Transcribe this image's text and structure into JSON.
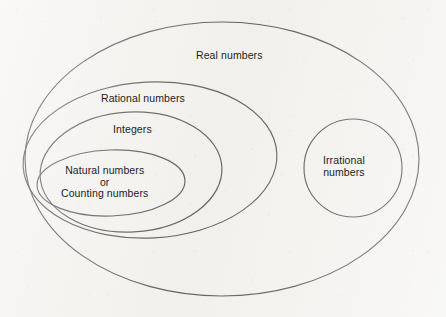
{
  "diagram": {
    "background_color": "#f4f3f0",
    "stroke_color": "#1f1f1f",
    "text_color": "#1c1c1c",
    "sets": {
      "real": {
        "label": "Real numbers",
        "shape": "ellipse",
        "cx": 222,
        "cy": 159,
        "rx": 197,
        "ry": 137
      },
      "rational": {
        "label": "Rational numbers",
        "shape": "ellipse",
        "cx": 150,
        "cy": 160,
        "rx": 127,
        "ry": 78
      },
      "integers": {
        "label": "Integers",
        "shape": "ellipse",
        "cx": 131,
        "cy": 172,
        "rx": 91,
        "ry": 60
      },
      "natural": {
        "label_line_1": "Natural numbers",
        "label_line_2": "or",
        "label_line_3": "Counting numbers",
        "shape": "ellipse",
        "cx": 111,
        "cy": 183,
        "rx": 74,
        "ry": 33
      },
      "irrational": {
        "label_line_1": "Irrational",
        "label_line_2": "numbers",
        "shape": "circle",
        "cx": 353,
        "cy": 168,
        "r": 49
      }
    }
  }
}
